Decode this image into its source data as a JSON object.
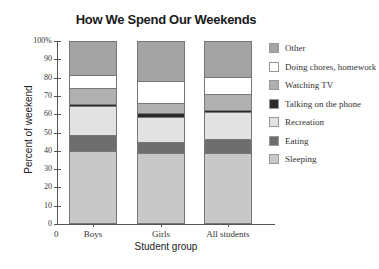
{
  "chart_data": {
    "type": "bar",
    "stacked": true,
    "title": "How We Spend Our Weekends",
    "xlabel": "Student group",
    "ylabel": "Percent of weekend",
    "ylim": [
      0,
      100
    ],
    "yticks": [
      "0",
      "10",
      "20",
      "30",
      "40",
      "50",
      "60",
      "70",
      "80",
      "90",
      "100%"
    ],
    "x_origin_label": "0",
    "categories": [
      "Boys",
      "Girls",
      "All students"
    ],
    "series": [
      {
        "name": "Sleeping",
        "color": "#c8c8c8",
        "values": [
          39,
          38,
          38
        ]
      },
      {
        "name": "Eating",
        "color": "#6e6e6e",
        "values": [
          9,
          6,
          8
        ]
      },
      {
        "name": "Recreation",
        "color": "#e2e2e2",
        "values": [
          16,
          14,
          15
        ]
      },
      {
        "name": "Talking on the phone",
        "color": "#2a2a2a",
        "values": [
          1,
          2,
          1
        ]
      },
      {
        "name": "Watching TV",
        "color": "#b0b0b0",
        "values": [
          9,
          6,
          9
        ]
      },
      {
        "name": "Doing chores, homework",
        "color": "#ffffff",
        "values": [
          7,
          12,
          9
        ]
      },
      {
        "name": "Other",
        "color": "#a4a4a4",
        "values": [
          19,
          22,
          20
        ]
      }
    ],
    "legend": {
      "position": "right",
      "entries": [
        "Other",
        "Doing chores, homework",
        "Watching TV",
        "Talking on the phone",
        "Recreation",
        "Eating",
        "Sleeping"
      ]
    },
    "grid": false
  }
}
